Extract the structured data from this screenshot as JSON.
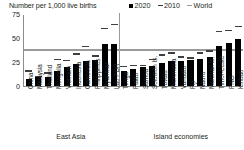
{
  "header": {
    "axis_title": "Number per 1,000 live births"
  },
  "legend": {
    "position": "top-right",
    "items": [
      {
        "label": "2020",
        "marker": "filled-square",
        "color": "#000000"
      },
      {
        "label": "2010",
        "marker": "dash",
        "color": "#3f3f3f"
      },
      {
        "label": "World",
        "marker": "line",
        "color": "#9a9a9a"
      }
    ]
  },
  "axes": {
    "yticks": [
      "0",
      "25",
      "50",
      "75"
    ],
    "ymin": 0,
    "ymax": 75
  },
  "groups": [
    {
      "name": "East Asia",
      "count": 10
    },
    {
      "name": "Island economies",
      "count": 13
    }
  ],
  "chart_data": {
    "type": "bar",
    "title": "",
    "xlabel": "",
    "ylabel": "Number per 1,000 live births",
    "ylim": [
      0,
      75
    ],
    "grid": false,
    "legend_position": "top-right",
    "categories": [
      "China",
      "Malaysia",
      "Thailand",
      "Mongolia",
      "Vietnam",
      "Indonesia",
      "Cambodia",
      "Philippines",
      "Myanmar",
      "Lao PDR",
      "Tonga",
      "Palau",
      "Samoa",
      "Solomon Is.",
      "Tuvalu",
      "Micronesia",
      "Vanuatu",
      "Fiji",
      "Nauru",
      "Marshall Is.",
      "Timor-Leste",
      "PNG",
      "Kiribati"
    ],
    "groups": [
      "East Asia",
      "Island economies"
    ],
    "group_sizes": [
      10,
      13
    ],
    "series": [
      {
        "name": "2020",
        "type": "bar",
        "color": "#000000",
        "values": [
          7,
          9,
          9,
          16,
          20,
          23,
          26,
          27,
          44,
          44,
          16,
          18,
          20,
          21,
          24,
          26,
          26,
          27,
          29,
          31,
          42,
          45,
          50
        ]
      },
      {
        "name": "2010",
        "type": "marker",
        "color": "#3f3f3f",
        "values": [
          15,
          9,
          13,
          27,
          26,
          33,
          41,
          31,
          60,
          64,
          20,
          21,
          21,
          27,
          32,
          34,
          30,
          29,
          34,
          36,
          57,
          58,
          62
        ]
      }
    ],
    "reference_line": {
      "name": "World",
      "value": 37,
      "color": "#9a9a9a"
    }
  }
}
